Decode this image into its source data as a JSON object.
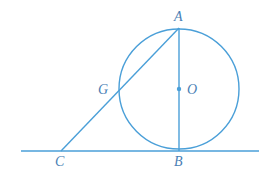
{
  "diagram": {
    "stroke_color": "#4a9fd8",
    "label_color": "#4a7fb5",
    "points": {
      "A": {
        "label": "A",
        "x": 179,
        "y": 28
      },
      "B": {
        "label": "B",
        "x": 179,
        "y": 151
      },
      "C": {
        "label": "C",
        "x": 61,
        "y": 151
      },
      "G": {
        "label": "G",
        "x": 119,
        "y": 90
      },
      "O": {
        "label": "O",
        "x": 179,
        "y": 89
      }
    },
    "circle": {
      "center": "O",
      "radius": 60
    },
    "segments": [
      {
        "from": "A",
        "to": "B",
        "name": "diameter AB"
      },
      {
        "from": "A",
        "to": "C",
        "name": "secant AC through G"
      }
    ],
    "tangent_line": {
      "x1": 21,
      "y1": 151,
      "x2": 259,
      "y2": 151,
      "tangent_at": "B"
    },
    "labels": {
      "A": "A",
      "B": "B",
      "C": "C",
      "G": "G",
      "O": "O"
    }
  }
}
